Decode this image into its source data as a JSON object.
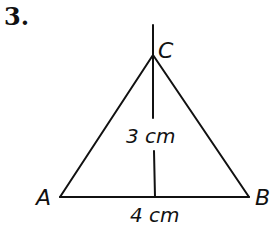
{
  "problem_number": "3.",
  "diagram": {
    "type": "triangle",
    "vertices": {
      "A": {
        "label": "A"
      },
      "B": {
        "label": "B"
      },
      "C": {
        "label": "C"
      }
    },
    "height_label": "3 cm",
    "base_label": "4 cm"
  }
}
